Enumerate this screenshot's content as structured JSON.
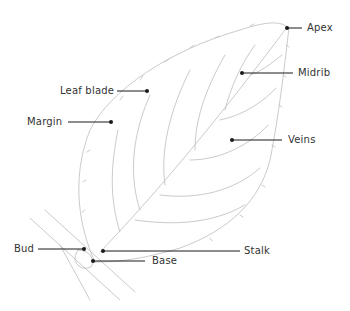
{
  "diagram": {
    "type": "labeled-leaf-anatomy",
    "colors": {
      "line": "#1a1a1a",
      "sketch": "#b8b8b8",
      "text": "#333333"
    },
    "labels": [
      {
        "id": "apex",
        "text": "Apex"
      },
      {
        "id": "midrib",
        "text": "Midrib"
      },
      {
        "id": "leaf-blade",
        "text": "Leaf blade"
      },
      {
        "id": "margin",
        "text": "Margin"
      },
      {
        "id": "veins",
        "text": "Veins"
      },
      {
        "id": "bud",
        "text": "Bud"
      },
      {
        "id": "stalk",
        "text": "Stalk"
      },
      {
        "id": "base",
        "text": "Base"
      }
    ]
  }
}
